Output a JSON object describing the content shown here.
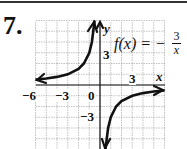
{
  "problem_number": "7.",
  "function_label": "f(x) = −",
  "fraction": {
    "numerator": "3",
    "denominator": "x"
  },
  "axes": {
    "x_label": "x",
    "y_label": "y"
  },
  "tick_labels": {
    "x_neg6": "−6",
    "x_neg3": "−3",
    "origin": "0",
    "x_pos3": "3",
    "y_pos3": "3",
    "y_neg3": "−3"
  },
  "chart_data": {
    "type": "line",
    "xlabel": "x",
    "ylabel": "y",
    "xlim": [
      -6,
      6
    ],
    "ylim": [
      -6,
      6
    ],
    "grid": true,
    "x_ticks_labeled": [
      -6,
      -3,
      0,
      3
    ],
    "y_ticks_labeled": [
      3,
      -3
    ],
    "series": [
      {
        "name": "f(x) = -3/x (left branch)",
        "x": [
          -6,
          -5,
          -4,
          -3,
          -2,
          -1.5,
          -1,
          -0.75,
          -0.5
        ],
        "y": [
          0.5,
          0.6,
          0.75,
          1,
          1.5,
          2,
          3,
          4,
          6
        ]
      },
      {
        "name": "f(x) = -3/x (right branch)",
        "x": [
          0.5,
          0.75,
          1,
          1.5,
          2,
          3,
          4,
          5,
          6
        ],
        "y": [
          -6,
          -4,
          -3,
          -2,
          -1.5,
          -1,
          -0.75,
          -0.6,
          -0.5
        ]
      }
    ],
    "asymptotes": {
      "vertical": 0,
      "horizontal": 0
    }
  }
}
